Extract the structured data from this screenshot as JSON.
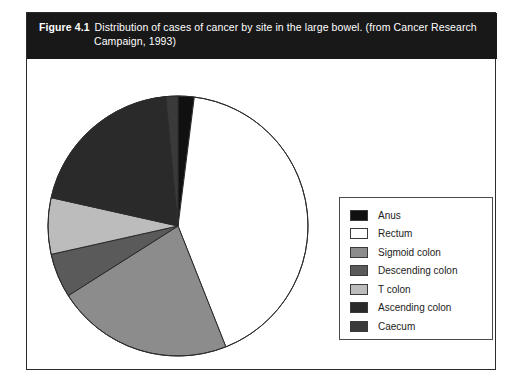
{
  "figure": {
    "label": "Figure 4.1",
    "caption_line1": "Distribution of cases of cancer by site in the large bowel.  (from Cancer Research",
    "caption_line2": "Campaign, 1993)"
  },
  "legend": {
    "items": [
      {
        "label": "Anus",
        "color": "#101010"
      },
      {
        "label": "Rectum",
        "color": "#ffffff"
      },
      {
        "label": "Sigmoid colon",
        "color": "#8c8c8c"
      },
      {
        "label": "Descending colon",
        "color": "#5a5a5a"
      },
      {
        "label": "T colon",
        "color": "#bcbcbc"
      },
      {
        "label": "Ascending colon",
        "color": "#2a2a2a"
      },
      {
        "label": "Caecum",
        "color": "#3a3a3a"
      }
    ]
  },
  "chart_data": {
    "type": "pie",
    "title": "Distribution of cases of cancer by site in the large bowel.  (from Cancer Research Campaign, 1993)",
    "categories": [
      "Anus",
      "Rectum",
      "Sigmoid colon",
      "Descending colon",
      "T colon",
      "Ascending colon",
      "Caecum"
    ],
    "values": [
      2,
      42,
      22,
      5.5,
      7,
      20,
      1.5
    ],
    "unit": "percent",
    "start_angle_deg": 0,
    "direction": "clockwise",
    "colors": [
      "#101010",
      "#ffffff",
      "#8c8c8c",
      "#5a5a5a",
      "#bcbcbc",
      "#2a2a2a",
      "#3a3a3a"
    ],
    "slice_angles_deg": [
      7.2,
      151.2,
      79.2,
      19.8,
      25.2,
      73.8,
      5.4
    ],
    "legend_position": "right",
    "grid": false,
    "xlabel": "",
    "ylabel": ""
  }
}
